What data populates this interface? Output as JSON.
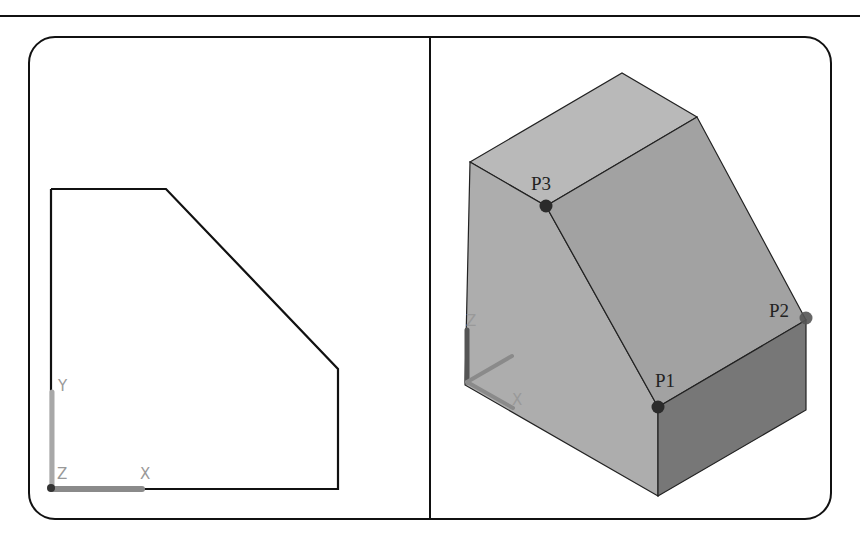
{
  "figure": {
    "left_view": {
      "name": "2D profile (XY plane)",
      "axes": {
        "x_label": "X",
        "y_label": "Y",
        "z_label": "Z"
      }
    },
    "right_view": {
      "name": "3D isometric solid",
      "axes": {
        "z_label": "Z",
        "x_label": "X"
      },
      "points": [
        {
          "id": "P1",
          "label": "P1"
        },
        {
          "id": "P2",
          "label": "P2"
        },
        {
          "id": "P3",
          "label": "P3"
        }
      ]
    },
    "colors": {
      "outline": "#111111",
      "face_top": "#b9b9b9",
      "face_left": "#adadad",
      "face_slope": "#a3a3a3",
      "face_right": "#7a7a7a",
      "point": "#2b2b2b",
      "axis_gray": "#9a9a9a"
    }
  }
}
